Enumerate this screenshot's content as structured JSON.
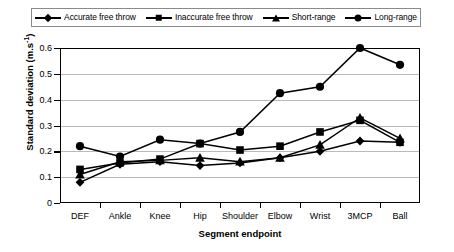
{
  "chart_data": {
    "type": "line",
    "title": "",
    "xlabel": "Segment endpoint",
    "ylabel": "Standard deviation (m.s-1)",
    "ylabel_base": "Standard deviation (m.s",
    "ylabel_exp": "-1",
    "ylabel_tail": ")",
    "categories": [
      "DEF",
      "Ankle",
      "Knee",
      "Hip",
      "Shoulder",
      "Elbow",
      "Wrist",
      "3MCP",
      "Ball"
    ],
    "ylim": [
      0,
      0.6
    ],
    "yticks": [
      "0.6",
      "0.5",
      "0.4",
      "0.3",
      "0.2",
      "0.1",
      "0"
    ],
    "ytick_values": [
      0.6,
      0.5,
      0.4,
      0.3,
      0.2,
      0.1,
      0
    ],
    "grid": true,
    "legend_position": "top",
    "series": [
      {
        "name": "Accurate free throw",
        "marker": "diamond",
        "values": [
          0.08,
          0.15,
          0.16,
          0.145,
          0.155,
          0.175,
          0.2,
          0.24,
          0.235
        ]
      },
      {
        "name": "Inaccurate free throw",
        "marker": "square",
        "values": [
          0.13,
          0.155,
          0.17,
          0.23,
          0.205,
          0.22,
          0.275,
          0.32,
          0.235
        ]
      },
      {
        "name": "Short-range",
        "marker": "triangle",
        "values": [
          0.11,
          0.16,
          0.165,
          0.175,
          0.16,
          0.175,
          0.225,
          0.33,
          0.25
        ]
      },
      {
        "name": "Long-range",
        "marker": "circle",
        "values": [
          0.22,
          0.18,
          0.245,
          0.23,
          0.275,
          0.425,
          0.45,
          0.6,
          0.535
        ]
      }
    ]
  },
  "colors": {
    "series": "#000000",
    "grid": "#b9b9b9",
    "axis": "#000000",
    "background": "#ffffff"
  }
}
